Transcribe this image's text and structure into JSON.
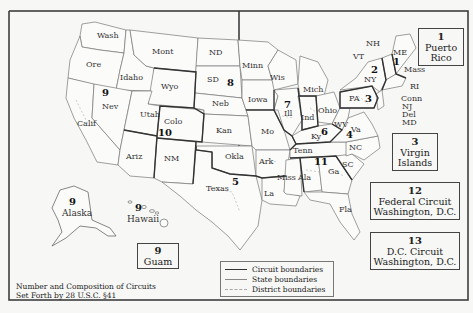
{
  "map": {
    "title_caption_line1": "Number and Composition of Circuits",
    "title_caption_line2": "Set Forth by 28 U.S.C. §41",
    "legend": {
      "circuit": "Circuit boundaries",
      "state": "State boundaries",
      "district": "District boundaries"
    },
    "states": {
      "wash": "Wash",
      "ore": "Ore",
      "calif": "Calif",
      "idaho": "Idaho",
      "nev": "Nev",
      "mont": "Mont",
      "wyo": "Wyo",
      "utah": "Utah",
      "colo": "Colo",
      "ariz": "Ariz",
      "nm": "NM",
      "nd": "ND",
      "sd": "SD",
      "neb": "Neb",
      "kan": "Kan",
      "okla": "Okla",
      "texas": "Texas",
      "minn": "Minn",
      "iowa": "Iowa",
      "mo": "Mo",
      "ark": "Ark",
      "la": "La",
      "wis": "Wis",
      "ill": "Ill",
      "ind": "Ind",
      "mich": "Mich",
      "ohio": "Ohio",
      "ky": "Ky",
      "tenn": "Tenn",
      "miss": "Miss",
      "ala": "Ala",
      "ga": "Ga",
      "fla": "Fla",
      "sc": "SC",
      "nc": "NC",
      "va": "Va",
      "wv": "WV",
      "pa": "PA",
      "ny": "NY",
      "vt": "VT",
      "nh": "NH",
      "me": "ME",
      "mass": "Mass",
      "ri": "RI",
      "conn": "Conn",
      "nj": "NJ",
      "del": "Del",
      "md": "MD",
      "alaska": "Alaska",
      "hawaii": "Hawaii"
    },
    "circuit_numbers": {
      "c1": "1",
      "c2": "2",
      "c3": "3",
      "c4": "4",
      "c5": "5",
      "c6": "6",
      "c7": "7",
      "c8": "8",
      "c9_west": "9",
      "c9_alaska": "9",
      "c9_hawaii": "9",
      "c10": "10",
      "c11": "11"
    },
    "boxes": {
      "puerto_rico": {
        "number": "1",
        "line1": "Puerto",
        "line2": "Rico"
      },
      "virgin_islands": {
        "number": "3",
        "line1": "Virgin",
        "line2": "Islands"
      },
      "federal": {
        "number": "12",
        "line1": "Federal Circuit",
        "line2": "Washington, D.C."
      },
      "dc": {
        "number": "13",
        "line1": "D.C. Circuit",
        "line2": "Washington, D.C."
      },
      "guam": {
        "number": "9",
        "line1": "Guam"
      }
    },
    "colors": {
      "circuit_line": "#333333",
      "state_line": "#888888",
      "district_line": "#aaaaaa",
      "background": "#f7f7f5"
    }
  }
}
